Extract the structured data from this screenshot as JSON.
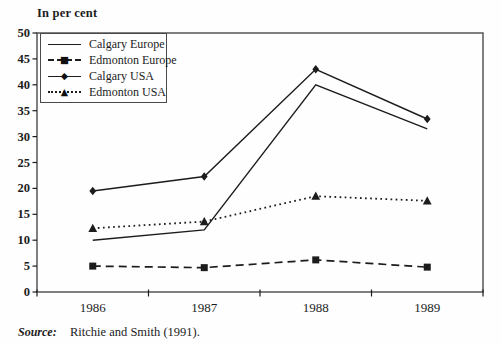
{
  "figure": {
    "background": "#fefefe",
    "ink_color": "#1c1c1c",
    "frame_color": "#4a4a4a"
  },
  "chart_data": {
    "type": "line",
    "title": "In per cent",
    "categories": [
      "1986",
      "1987",
      "1988",
      "1989"
    ],
    "ylim": [
      0,
      50
    ],
    "ytick_step": 5,
    "grid": false,
    "legend_position": "top-left-inside",
    "series": [
      {
        "name": "Calgary Europe",
        "values": [
          10,
          12,
          40,
          31.5
        ],
        "line_style": "solid",
        "marker": "none",
        "marker_glyph": ""
      },
      {
        "name": "Edmonton Europe",
        "values": [
          5,
          4.7,
          6.2,
          4.8
        ],
        "line_style": "dashed",
        "marker": "square",
        "marker_glyph": "■"
      },
      {
        "name": "Calgary USA",
        "values": [
          19.5,
          22.3,
          43,
          33.4
        ],
        "line_style": "solid",
        "marker": "diamond",
        "marker_glyph": "◆"
      },
      {
        "name": "Edmonton USA",
        "values": [
          12.3,
          13.6,
          18.5,
          17.6
        ],
        "line_style": "dotted",
        "marker": "triangle",
        "marker_glyph": "▲"
      }
    ]
  },
  "source": {
    "label": "Source:",
    "text": "Ritchie and Smith (1991)."
  }
}
